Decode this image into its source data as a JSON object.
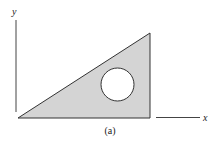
{
  "figure": {
    "caption": "(a)",
    "axes": {
      "x_label": "x",
      "y_label": "y"
    },
    "shape": {
      "type": "right triangle with circular hole",
      "fill_color": "#d4d4d4",
      "stroke_color": "#333333",
      "hole_fill": "#ffffff"
    }
  }
}
